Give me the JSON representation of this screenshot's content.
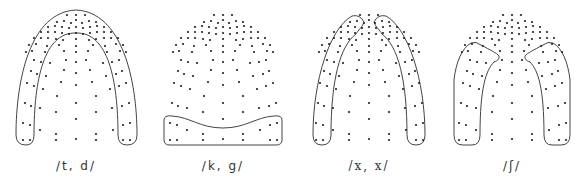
{
  "figure": {
    "type": "electropalatography contact patterns",
    "dot_color": "#222222",
    "outline_color": "#444444",
    "dot_template": [
      [
        -9,
        15
      ],
      [
        0,
        15
      ],
      [
        9,
        15
      ],
      [
        0,
        20
      ],
      [
        -19,
        22
      ],
      [
        -12,
        21
      ],
      [
        -5,
        23
      ],
      [
        6,
        23
      ],
      [
        13,
        21
      ],
      [
        20,
        22
      ],
      [
        -28,
        27
      ],
      [
        -21,
        26
      ],
      [
        -14,
        27
      ],
      [
        -7,
        28
      ],
      [
        0,
        27
      ],
      [
        7,
        28
      ],
      [
        14,
        27
      ],
      [
        21,
        26
      ],
      [
        28,
        27
      ],
      [
        -35,
        32
      ],
      [
        -28,
        32
      ],
      [
        -21,
        32
      ],
      [
        -14,
        33
      ],
      [
        -7,
        34
      ],
      [
        0,
        33
      ],
      [
        7,
        34
      ],
      [
        14,
        33
      ],
      [
        21,
        32
      ],
      [
        28,
        32
      ],
      [
        35,
        32
      ],
      [
        -42,
        38
      ],
      [
        -35,
        38
      ],
      [
        -28,
        38
      ],
      [
        -20,
        39
      ],
      [
        -13,
        40
      ],
      [
        0,
        39
      ],
      [
        13,
        40
      ],
      [
        20,
        39
      ],
      [
        28,
        38
      ],
      [
        35,
        38
      ],
      [
        42,
        38
      ],
      [
        -47,
        45
      ],
      [
        -40,
        44
      ],
      [
        -29,
        46
      ],
      [
        -17,
        45
      ],
      [
        0,
        46
      ],
      [
        17,
        45
      ],
      [
        29,
        46
      ],
      [
        40,
        44
      ],
      [
        47,
        45
      ],
      [
        -50,
        52
      ],
      [
        -44,
        51
      ],
      [
        -31,
        52
      ],
      [
        -12,
        51
      ],
      [
        0,
        52
      ],
      [
        12,
        51
      ],
      [
        31,
        52
      ],
      [
        44,
        51
      ],
      [
        50,
        52
      ],
      [
        -42,
        60
      ],
      [
        -35,
        62
      ],
      [
        -26,
        63
      ],
      [
        -10,
        60
      ],
      [
        0,
        62
      ],
      [
        10,
        60
      ],
      [
        27,
        63
      ],
      [
        36,
        62
      ],
      [
        43,
        60
      ],
      [
        -45,
        71
      ],
      [
        -39,
        74
      ],
      [
        -30,
        76
      ],
      [
        -12,
        70
      ],
      [
        0,
        73
      ],
      [
        14,
        70
      ],
      [
        30,
        76
      ],
      [
        40,
        74
      ],
      [
        46,
        71
      ],
      [
        -49,
        83
      ],
      [
        -42,
        86
      ],
      [
        -33,
        89
      ],
      [
        -15,
        82
      ],
      [
        0,
        85
      ],
      [
        16,
        82
      ],
      [
        34,
        89
      ],
      [
        43,
        86
      ],
      [
        50,
        83
      ],
      [
        -19,
        96
      ],
      [
        20,
        96
      ],
      [
        -51,
        103
      ],
      [
        -45,
        106
      ],
      [
        -36,
        108
      ],
      [
        0,
        103
      ],
      [
        36,
        108
      ],
      [
        46,
        106
      ],
      [
        53,
        103
      ],
      [
        -20,
        112
      ],
      [
        20,
        112
      ],
      [
        0,
        119
      ],
      [
        -53,
        123
      ],
      [
        -46,
        125
      ],
      [
        -36,
        130
      ],
      [
        37,
        130
      ],
      [
        47,
        125
      ],
      [
        54,
        123
      ],
      [
        -20,
        134
      ],
      [
        20,
        134
      ],
      [
        -53,
        140
      ],
      [
        -46,
        140
      ],
      [
        -20,
        140
      ],
      [
        0,
        139
      ],
      [
        20,
        140
      ],
      [
        47,
        140
      ],
      [
        54,
        140
      ]
    ],
    "palates": [
      {
        "label": "/t, d/",
        "center_x": 76,
        "label_font": "sans",
        "outlines": [
          "M 26 145 Q 16 145 16 135 C 16 80 30 12 76 10 C 122 12 137 80 137 135 Q 137 145 127 145 Q 118 145 118 135 C 118 80 108 32 76 33 C 44 32 34 80 34 135 Q 34 145 26 145 Z"
        ]
      },
      {
        "label": "/k, g/",
        "center_x": 223,
        "label_font": "sans",
        "outlines": [
          "M 164 120 Q 164 115 172 116 C 190 117 200 128 223 128 C 246 128 256 117 274 116 Q 282 115 282 120 L 282 140 Q 282 145 276 145 L 170 145 Q 164 145 164 140 Z"
        ]
      },
      {
        "label": "/x, x/",
        "center_x": 369,
        "label_font": "serif",
        "outlines": [
          "M 322 145 Q 313 145 313 135 C 313 80 330 28 352 16 Q 360 14 364 22 C 362 28 358 30 356 34 C 340 46 331 80 331 135 Q 331 145 322 145 Z",
          "M 416 145 Q 425 145 425 135 C 425 80 408 28 386 16 Q 378 14 374 22 C 376 28 380 30 382 34 C 398 46 407 80 407 135 Q 407 145 416 145 Z"
        ]
      },
      {
        "label": "/ʃ/",
        "center_x": 512,
        "label_font": "sans",
        "outlines": [
          "M 463 145 Q 454 145 454 135 L 454 80 C 456 62 462 48 471 43 Q 476 41 481 45 C 490 50 497 53 499 56 Q 500 60 494 62 C 486 70 480 88 480 135 Q 480 145 472 145 Z",
          "M 561 145 Q 570 145 570 135 L 570 80 C 568 62 562 48 553 43 Q 548 41 543 45 C 534 50 527 53 525 56 Q 524 60 530 62 C 538 70 544 88 544 135 Q 544 145 552 145 Z"
        ]
      }
    ]
  }
}
